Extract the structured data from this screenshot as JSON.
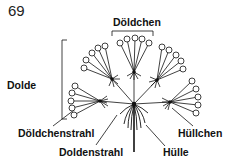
{
  "figure": {
    "number": "69",
    "labels": {
      "doldchen": "Döldchen",
      "dolde": "Dolde",
      "doldchenstrahl": "Döldchenstrahl",
      "doldenstrahl": "Doldenstrahl",
      "hulle": "Hülle",
      "hullchen": "Hüllchen"
    },
    "colors": {
      "ink": "#111111",
      "background": "#ffffff"
    }
  }
}
